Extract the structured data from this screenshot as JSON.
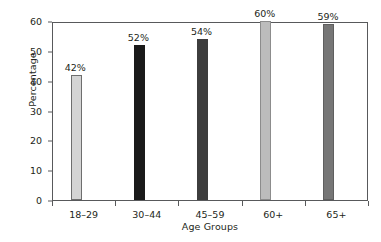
{
  "chart_data": {
    "type": "bar",
    "title": "",
    "subtitle": "",
    "xlabel": "Age Groups",
    "ylabel": "Percentage",
    "categories": [
      "18–29",
      "30–44",
      "45–59",
      "60+",
      "65+"
    ],
    "values": [
      42,
      52,
      54,
      60,
      59
    ],
    "data_labels": [
      "42%",
      "52%",
      "54%",
      "60%",
      "59%"
    ],
    "bar_colors": [
      "#d4d4d4",
      "#1a1a1a",
      "#3d3d3d",
      "#bcbcbc",
      "#767676"
    ],
    "bar_edge_colors": [
      "#6e6e6e",
      "#1a1a1a",
      "#3d3d3d",
      "#8c8c8c",
      "#5f5f5f"
    ],
    "ylim": [
      0,
      60
    ],
    "y_ticks": [
      0,
      10,
      20,
      30,
      40,
      50,
      60
    ],
    "y_tick_labels": [
      "0",
      "10",
      "20",
      "30",
      "40",
      "50",
      "60"
    ],
    "grid": false,
    "legend": null,
    "axis_color": "#58595b",
    "background_color": "#ffffff",
    "text_color": "#231f20"
  }
}
